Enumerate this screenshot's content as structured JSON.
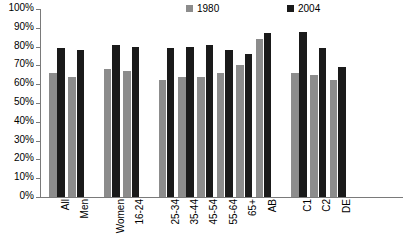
{
  "chart_data": {
    "type": "bar",
    "title": "",
    "subtitle": "",
    "xlabel": "",
    "ylabel": "",
    "ylim": [
      0,
      100
    ],
    "y_tick_labels": [
      "100%",
      "90%",
      "80%",
      "70%",
      "60%",
      "50%",
      "40%",
      "30%",
      "20%",
      "10%",
      "0%"
    ],
    "y_tick_values": [
      100,
      90,
      80,
      70,
      60,
      50,
      40,
      30,
      20,
      10,
      0
    ],
    "grid": false,
    "legend_position": "top-right",
    "categories": [
      "All",
      "Men",
      "Women",
      "16-24",
      "25-34",
      "35-44",
      "45-54",
      "55-64",
      "65+",
      "AB",
      "C1",
      "C2",
      "DE"
    ],
    "series": [
      {
        "name": "1980",
        "color": "#8c8c8c",
        "values": [
          66,
          64,
          68,
          67,
          62,
          64,
          64,
          66,
          70,
          84,
          66,
          65,
          62
        ]
      },
      {
        "name": "2004",
        "color": "#1a1a1a",
        "values": [
          79,
          78,
          81,
          80,
          79,
          80,
          81,
          78,
          76,
          87,
          88,
          79,
          69
        ]
      }
    ],
    "group_breaks": [
      1,
      3,
      9
    ]
  },
  "legend": {
    "entries": [
      {
        "label": "1980",
        "color": "#8c8c8c"
      },
      {
        "label": "2004",
        "color": "#1a1a1a"
      }
    ]
  },
  "axis": {
    "line_color": "#7a7a7a"
  }
}
